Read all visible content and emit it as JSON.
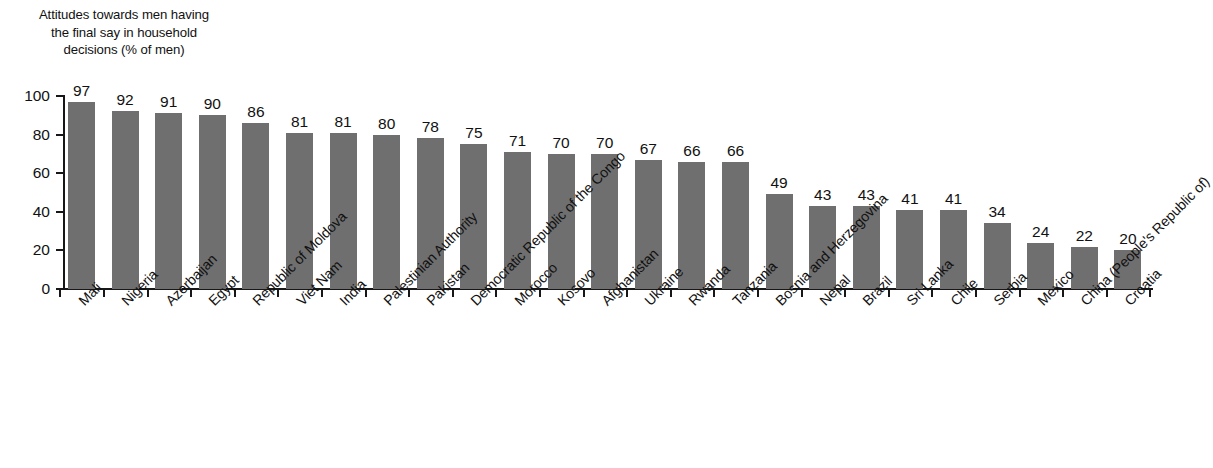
{
  "chart_data": {
    "type": "bar",
    "title": "Attitudes towards men having\nthe final say in household\ndecisions (% of men)",
    "xlabel": "",
    "ylabel": "",
    "ylim": [
      0,
      100
    ],
    "yticks": [
      0,
      20,
      40,
      60,
      80,
      100
    ],
    "grid": false,
    "legend": null,
    "bar_color": "#6f6f6f",
    "axis_color": "#171717",
    "categories": [
      "Mali",
      "Nigeria",
      "Azerbaijan",
      "Egypt",
      "Republic of Moldova",
      "Viet Nam",
      "India",
      "Palestinian Authority",
      "Pakistan",
      "Democratic Republic of the Congo",
      "Morocco",
      "Kosovo",
      "Afghanistan",
      "Ukraine",
      "Rwanda",
      "Tanzania",
      "Bosnia and Herzegovina",
      "Nepal",
      "Brazil",
      "Sri Lanka",
      "Chile",
      "Serbia",
      "Mexico",
      "China (People's Republic of)",
      "Croatia"
    ],
    "values": [
      97,
      92,
      91,
      90,
      86,
      81,
      81,
      80,
      78,
      75,
      71,
      70,
      70,
      67,
      66,
      66,
      49,
      43,
      43,
      41,
      41,
      34,
      24,
      22,
      20
    ]
  }
}
